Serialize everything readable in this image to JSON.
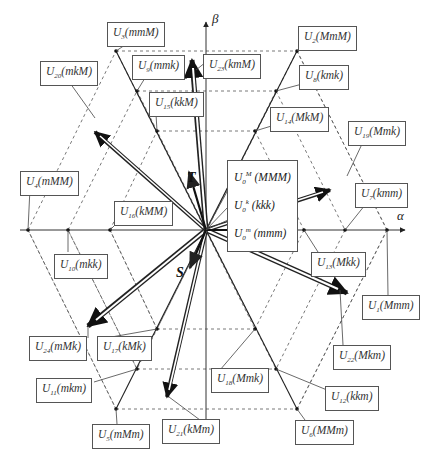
{
  "axes": {
    "alpha": "α",
    "beta": "β"
  },
  "reference_vectors": {
    "R": "R",
    "S": "S",
    "T": "T"
  },
  "zero_vectors": [
    {
      "sup": "M",
      "state": "(MMM)"
    },
    {
      "sup": "k",
      "state": "(kkk)"
    },
    {
      "sup": "m",
      "state": "(mmm)"
    }
  ],
  "labels": [
    {
      "id": "U3",
      "sub": "3",
      "state": "(mmM)",
      "x": 107,
      "y": 22
    },
    {
      "id": "U20",
      "sub": "20",
      "state": "(mkM)",
      "x": 40,
      "y": 61
    },
    {
      "id": "U9",
      "sub": "9",
      "state": "(mmk)",
      "x": 132,
      "y": 55
    },
    {
      "id": "U15",
      "sub": "15",
      "state": "(kkM)",
      "x": 149,
      "y": 92
    },
    {
      "id": "U23",
      "sub": "23",
      "state": "(kmM)",
      "x": 203,
      "y": 54
    },
    {
      "id": "U2",
      "sub": "2",
      "state": "(MmM)",
      "x": 298,
      "y": 26
    },
    {
      "id": "U8",
      "sub": "8",
      "state": "(kmk)",
      "x": 299,
      "y": 65
    },
    {
      "id": "U14",
      "sub": "14",
      "state": "(MkM)",
      "x": 270,
      "y": 107
    },
    {
      "id": "U19",
      "sub": "19",
      "state": "(Mmk)",
      "x": 348,
      "y": 121
    },
    {
      "id": "U4",
      "sub": "4",
      "state": "(mMM)",
      "x": 20,
      "y": 171
    },
    {
      "id": "U16",
      "sub": "16",
      "state": "(kMM)",
      "x": 114,
      "y": 201
    },
    {
      "id": "U10",
      "sub": "10",
      "state": "(mkk)",
      "x": 54,
      "y": 254
    },
    {
      "id": "U7",
      "sub": "7",
      "state": "(kmm)",
      "x": 355,
      "y": 183
    },
    {
      "id": "U13",
      "sub": "13",
      "state": "(Mkk)",
      "x": 311,
      "y": 252
    },
    {
      "id": "U1",
      "sub": "1",
      "state": "(Mmm)",
      "x": 362,
      "y": 295
    },
    {
      "id": "U22",
      "sub": "22",
      "state": "(Mkm)",
      "x": 333,
      "y": 345
    },
    {
      "id": "U24",
      "sub": "24",
      "state": "(mMk)",
      "x": 29,
      "y": 336
    },
    {
      "id": "U17",
      "sub": "17",
      "state": "(kMk)",
      "x": 97,
      "y": 336
    },
    {
      "id": "U11",
      "sub": "11",
      "state": "(mkm)",
      "x": 36,
      "y": 378
    },
    {
      "id": "U5",
      "sub": "5",
      "state": "(mMm)",
      "x": 92,
      "y": 424
    },
    {
      "id": "U21",
      "sub": "21",
      "state": "(kMm)",
      "x": 162,
      "y": 419
    },
    {
      "id": "U18",
      "sub": "18",
      "state": "(Mmk)",
      "x": 211,
      "y": 368
    },
    {
      "id": "U12",
      "sub": "12",
      "state": "(kkm)",
      "x": 325,
      "y": 386
    },
    {
      "id": "U6",
      "sub": "6",
      "state": "(MMm)",
      "x": 295,
      "y": 420
    }
  ]
}
